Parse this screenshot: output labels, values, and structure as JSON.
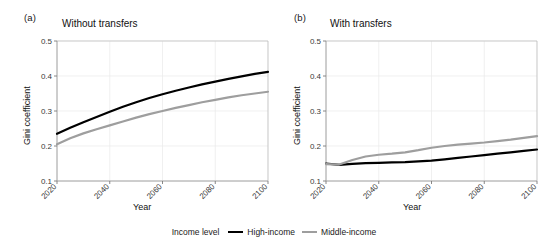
{
  "figure": {
    "background": "#ffffff"
  },
  "legend": {
    "title": "Income level",
    "entries": [
      {
        "label": "High-income",
        "color": "#000000"
      },
      {
        "label": "Middle-income",
        "color": "#9e9e9e"
      }
    ]
  },
  "panels": [
    {
      "tag": "(a)",
      "title": "Without transfers",
      "xlabel": "Year",
      "ylabel": "Gini coefficient"
    },
    {
      "tag": "(b)",
      "title": "With transfers",
      "xlabel": "Year",
      "ylabel": "Gini coefficient"
    }
  ],
  "chart_data": [
    {
      "type": "line",
      "title": "Without transfers",
      "panel_tag": "(a)",
      "xlabel": "Year",
      "ylabel": "Gini coefficient",
      "xlim": [
        2020,
        2100
      ],
      "ylim": [
        0.1,
        0.5
      ],
      "yticks": [
        0.1,
        0.2,
        0.3,
        0.4,
        0.5
      ],
      "ytick_labels": [
        "0.1",
        "0.2",
        "0.3",
        "0.4",
        "0.5"
      ],
      "xticks": [
        2020,
        2040,
        2060,
        2080,
        2100
      ],
      "xtick_labels": [
        "2020",
        "2040",
        "2060",
        "2080",
        "2100"
      ],
      "grid": true,
      "legend_position": "bottom-center-shared",
      "x": [
        2020,
        2025,
        2030,
        2035,
        2040,
        2045,
        2050,
        2055,
        2060,
        2065,
        2070,
        2075,
        2080,
        2085,
        2090,
        2095,
        2100
      ],
      "series": [
        {
          "name": "High-income",
          "color": "#000000",
          "values": [
            0.235,
            0.252,
            0.268,
            0.283,
            0.298,
            0.312,
            0.325,
            0.337,
            0.348,
            0.358,
            0.367,
            0.376,
            0.384,
            0.392,
            0.399,
            0.406,
            0.412
          ]
        },
        {
          "name": "Middle-income",
          "color": "#9e9e9e",
          "values": [
            0.205,
            0.222,
            0.236,
            0.248,
            0.259,
            0.27,
            0.281,
            0.291,
            0.3,
            0.309,
            0.317,
            0.325,
            0.332,
            0.339,
            0.345,
            0.35,
            0.355
          ]
        }
      ]
    },
    {
      "type": "line",
      "title": "With transfers",
      "panel_tag": "(b)",
      "xlabel": "Year",
      "ylabel": "Gini coefficient",
      "xlim": [
        2020,
        2100
      ],
      "ylim": [
        0.1,
        0.5
      ],
      "yticks": [
        0.1,
        0.2,
        0.3,
        0.4,
        0.5
      ],
      "ytick_labels": [
        "0.1",
        "0.2",
        "0.3",
        "0.4",
        "0.5"
      ],
      "xticks": [
        2020,
        2040,
        2060,
        2080,
        2100
      ],
      "xtick_labels": [
        "2020",
        "2040",
        "2060",
        "2080",
        "2100"
      ],
      "grid": true,
      "legend_position": "bottom-center-shared",
      "x": [
        2020,
        2025,
        2030,
        2035,
        2040,
        2045,
        2050,
        2055,
        2060,
        2065,
        2070,
        2075,
        2080,
        2085,
        2090,
        2095,
        2100
      ],
      "series": [
        {
          "name": "High-income",
          "color": "#000000",
          "values": [
            0.15,
            0.146,
            0.149,
            0.151,
            0.152,
            0.153,
            0.154,
            0.156,
            0.158,
            0.162,
            0.166,
            0.17,
            0.174,
            0.178,
            0.182,
            0.186,
            0.19
          ]
        },
        {
          "name": "Middle-income",
          "color": "#9e9e9e",
          "values": [
            0.148,
            0.147,
            0.16,
            0.17,
            0.175,
            0.178,
            0.182,
            0.188,
            0.195,
            0.2,
            0.204,
            0.207,
            0.21,
            0.214,
            0.218,
            0.223,
            0.228
          ]
        }
      ]
    }
  ]
}
